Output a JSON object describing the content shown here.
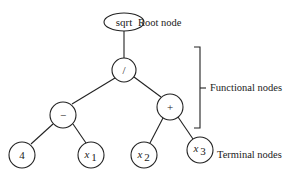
{
  "diagram": {
    "type": "expression-tree",
    "nodes": [
      {
        "id": "root",
        "label": "sqrt",
        "kind": "function",
        "shape": "ellipse"
      },
      {
        "id": "div",
        "label": "/",
        "kind": "function",
        "shape": "circle"
      },
      {
        "id": "minus",
        "label": "−",
        "kind": "function",
        "shape": "circle"
      },
      {
        "id": "plus",
        "label": "+",
        "kind": "function",
        "shape": "circle"
      },
      {
        "id": "t4",
        "label": "4",
        "kind": "terminal",
        "shape": "circle"
      },
      {
        "id": "x1",
        "label": "x",
        "sub": "1",
        "kind": "terminal",
        "shape": "circle"
      },
      {
        "id": "x2",
        "label": "x",
        "sub": "2",
        "kind": "terminal",
        "shape": "circle"
      },
      {
        "id": "x3",
        "label": "x",
        "sub": "3",
        "kind": "terminal",
        "shape": "circle"
      }
    ],
    "edges": [
      [
        "root",
        "div"
      ],
      [
        "div",
        "minus"
      ],
      [
        "div",
        "plus"
      ],
      [
        "minus",
        "t4"
      ],
      [
        "minus",
        "x1"
      ],
      [
        "plus",
        "x2"
      ],
      [
        "plus",
        "x3"
      ]
    ],
    "annotations": {
      "root": "Root node",
      "functional": "Functional nodes",
      "terminal": "Terminal nodes"
    }
  }
}
